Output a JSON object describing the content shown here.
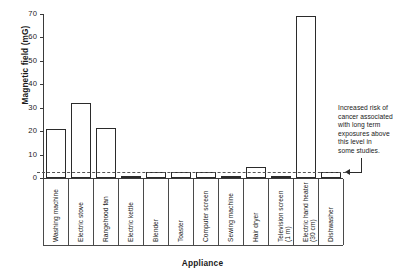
{
  "chart_data": {
    "type": "bar",
    "title": "",
    "xlabel": "Appliance",
    "ylabel": "Magnetic field (mG)",
    "ylim": [
      0,
      70
    ],
    "yticks": [
      0,
      10,
      20,
      30,
      40,
      50,
      60,
      70
    ],
    "grid": false,
    "legend": null,
    "categories": [
      "Washing machine",
      "Electric stove",
      "Rangehood fan",
      "Electric kettle",
      "Blender",
      "Toaster",
      "Computer screen",
      "Sewing machine",
      "Hair dryer",
      "Television screen (1 m)",
      "Electric hand heater (30 cm)",
      "Dishwasher"
    ],
    "values": [
      21,
      32,
      21.5,
      1,
      2.5,
      2.5,
      2.5,
      1,
      4.5,
      1,
      69,
      2.5
    ],
    "annotations": [
      {
        "name": "threshold-note",
        "text": "Increased risk of cancer associated with long term exposures above this level in some studies.",
        "points_to_value": 2.5
      }
    ],
    "reference_line": {
      "name": "risk-threshold",
      "value": 2.5,
      "style": "dashed"
    }
  },
  "axes": {
    "y_title": "Magnetic field (mG)",
    "x_title": "Appliance",
    "y_tick_labels": [
      "0",
      "10",
      "20",
      "30",
      "40",
      "50",
      "60",
      "70"
    ]
  },
  "categories": [
    {
      "label": "Washing machine",
      "sub": ""
    },
    {
      "label": "Electric stove",
      "sub": ""
    },
    {
      "label": "Rangehood fan",
      "sub": ""
    },
    {
      "label": "Electric kettle",
      "sub": ""
    },
    {
      "label": "Blender",
      "sub": ""
    },
    {
      "label": "Toaster",
      "sub": ""
    },
    {
      "label": "Computer screen",
      "sub": ""
    },
    {
      "label": "Sewing machine",
      "sub": ""
    },
    {
      "label": "Hair dryer",
      "sub": ""
    },
    {
      "label": "Television screen",
      "sub": "(1 m)"
    },
    {
      "label": "Electric hand heater",
      "sub": "(30 cm)"
    },
    {
      "label": "Dishwasher",
      "sub": ""
    }
  ],
  "annotation": {
    "lines": [
      "Increased risk of",
      "cancer associated",
      "with long term",
      "exposures above",
      "this level in",
      "some studies."
    ]
  },
  "colors": {
    "axis": "#3a3a3a",
    "bar_outline": "#2b2b2b",
    "bar_fill": "#ffffff",
    "threshold": "#555555",
    "text": "#1a1a1a",
    "background": "#ffffff"
  }
}
